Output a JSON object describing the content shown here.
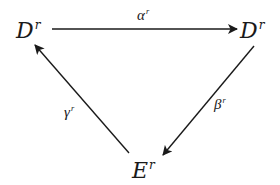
{
  "diagram": {
    "type": "commutative-triangle",
    "nodes": {
      "d_left": {
        "base": "D",
        "sup": "r"
      },
      "d_right": {
        "base": "D",
        "sup": "r"
      },
      "e_bottom": {
        "base": "E",
        "sup": "r"
      }
    },
    "edges": {
      "alpha": {
        "base": "α",
        "sup": "r",
        "from": "D^r (left)",
        "to": "D^r (right)"
      },
      "beta": {
        "base": "β",
        "sup": "r",
        "from": "D^r (right)",
        "to": "E^r"
      },
      "gamma": {
        "base": "γ",
        "sup": "r",
        "from": "E^r",
        "to": "D^r (left)"
      }
    },
    "colors": {
      "ink": "#1a1a1a",
      "background": "#ffffff"
    }
  }
}
